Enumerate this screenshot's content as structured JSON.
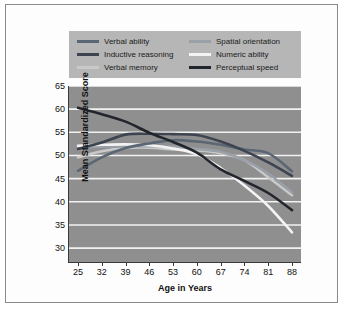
{
  "chart_data": {
    "type": "line",
    "title": "",
    "xlabel": "Age in Years",
    "ylabel": "Mean Standardized Score",
    "x": [
      25,
      32,
      39,
      46,
      53,
      60,
      67,
      74,
      81,
      88
    ],
    "xtick_labels": [
      "25",
      "32",
      "39",
      "46",
      "53",
      "60",
      "67",
      "74",
      "81",
      "88"
    ],
    "ytick_labels": [
      "65",
      "60",
      "55",
      "50",
      "45",
      "40",
      "35",
      "30"
    ],
    "xlim": [
      25,
      88
    ],
    "ylim": [
      27,
      65
    ],
    "grid": "horizontal",
    "legend_position": "top",
    "plot_background": "#8f8f8f",
    "gridline_color": "#f2f2f2",
    "series": [
      {
        "name": "Verbal ability",
        "color": "#5b6675",
        "values": [
          46.7,
          49.6,
          51.6,
          52.6,
          53.3,
          53.0,
          52.3,
          51.3,
          50.5,
          46.6
        ]
      },
      {
        "name": "Inductive reasoning",
        "color": "#3d4450",
        "values": [
          51.4,
          52.8,
          54.5,
          54.7,
          54.6,
          54.4,
          53.0,
          51.0,
          48.5,
          45.6
        ]
      },
      {
        "name": "Verbal memory",
        "color": "#c9c9c9",
        "values": [
          49.6,
          50.9,
          51.6,
          51.7,
          51.3,
          51.1,
          50.5,
          49.0,
          45.3,
          41.4
        ]
      },
      {
        "name": "Spatial orientation",
        "color": "#9aa0a8",
        "values": [
          51.7,
          51.9,
          52.0,
          52.0,
          51.9,
          51.4,
          50.8,
          49.0,
          46.1,
          42.0
        ]
      },
      {
        "name": "Numeric ability",
        "color": "#f3f3f3",
        "values": [
          52.1,
          52.3,
          52.4,
          52.2,
          51.5,
          50.3,
          47.3,
          43.5,
          39.1,
          33.4
        ]
      },
      {
        "name": "Perceptual speed",
        "color": "#22262c",
        "values": [
          60.3,
          58.9,
          57.3,
          54.9,
          52.9,
          50.6,
          47.0,
          44.5,
          41.9,
          38.2
        ]
      }
    ]
  },
  "legend": {
    "entries": [
      {
        "label": "Verbal ability",
        "color": "#5b6675"
      },
      {
        "label": "Spatial orientation",
        "color": "#9aa0a8"
      },
      {
        "label": "Inductive reasoning",
        "color": "#3d4450"
      },
      {
        "label": "Numeric ability",
        "color": "#f3f3f3"
      },
      {
        "label": "Verbal memory",
        "color": "#c9c9c9"
      },
      {
        "label": "Perceptual speed",
        "color": "#22262c"
      }
    ]
  }
}
